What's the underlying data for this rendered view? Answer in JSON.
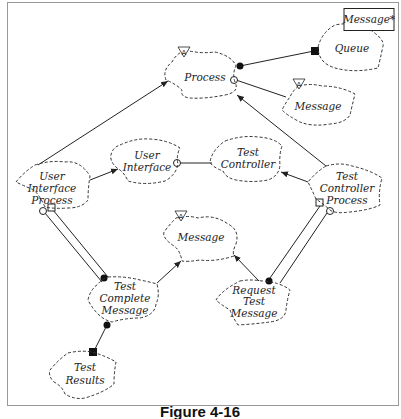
{
  "caption": "Figure 4-16",
  "nodes": [
    {
      "id": "process",
      "lines": [
        "Process"
      ],
      "abstract": true
    },
    {
      "id": "queue",
      "lines": [
        "Queue"
      ],
      "parameter": "Message*"
    },
    {
      "id": "message-top",
      "lines": [
        "Message"
      ],
      "abstract": true
    },
    {
      "id": "user-interface",
      "lines": [
        "User",
        "Interface"
      ]
    },
    {
      "id": "test-controller",
      "lines": [
        "Test",
        "Controller"
      ]
    },
    {
      "id": "user-interface-process",
      "lines": [
        "User",
        "Interface",
        "Process"
      ]
    },
    {
      "id": "test-controller-process",
      "lines": [
        "Test",
        "Controller",
        "Process"
      ]
    },
    {
      "id": "message-mid",
      "lines": [
        "Message"
      ],
      "abstract": true
    },
    {
      "id": "test-complete-message",
      "lines": [
        "Test",
        "Complete",
        "Message"
      ]
    },
    {
      "id": "request-test-message",
      "lines": [
        "Request",
        "Test",
        "Message"
      ]
    },
    {
      "id": "test-results",
      "lines": [
        "Test",
        "Results"
      ]
    }
  ],
  "edges": [
    {
      "from": "process",
      "to": "queue",
      "type": "has",
      "start": "filled-circle",
      "end": "filled-square"
    },
    {
      "from": "process",
      "to": "message-top",
      "type": "uses",
      "start": "open-circle"
    },
    {
      "from": "user-interface-process",
      "to": "process",
      "type": "inherits",
      "arrow": true
    },
    {
      "from": "test-controller-process",
      "to": "process",
      "type": "inherits",
      "arrow": true
    },
    {
      "from": "user-interface-process",
      "to": "user-interface",
      "type": "inherits",
      "arrow": true
    },
    {
      "from": "user-interface",
      "to": "test-controller",
      "type": "uses",
      "start": "open-circle"
    },
    {
      "from": "test-controller-process",
      "to": "test-controller",
      "type": "inherits",
      "arrow": true
    },
    {
      "from": "user-interface-process",
      "to": "test-complete-message",
      "type": "has-uses-double"
    },
    {
      "from": "test-controller-process",
      "to": "request-test-message",
      "type": "has-uses-double"
    },
    {
      "from": "test-complete-message",
      "to": "message-mid",
      "type": "inherits",
      "arrow": true
    },
    {
      "from": "request-test-message",
      "to": "message-mid",
      "type": "inherits",
      "arrow": true
    },
    {
      "from": "test-complete-message",
      "to": "test-results",
      "type": "has",
      "start": "filled-circle",
      "end": "filled-square"
    }
  ],
  "labels": {
    "process": "Process",
    "queue": "Queue",
    "queue_param": "Message*",
    "message_top": "Message",
    "ui_1": "User",
    "ui_2": "Interface",
    "tc_1": "Test",
    "tc_2": "Controller",
    "uip_1": "User",
    "uip_2": "Interface",
    "uip_3": "Process",
    "tcp_1": "Test",
    "tcp_2": "Controller",
    "tcp_3": "Process",
    "message_mid": "Message",
    "tcm_1": "Test",
    "tcm_2": "Complete",
    "tcm_3": "Message",
    "rtm_1": "Request",
    "rtm_2": "Test",
    "rtm_3": "Message",
    "tr_1": "Test",
    "tr_2": "Results",
    "abstract_glyph": "A"
  }
}
